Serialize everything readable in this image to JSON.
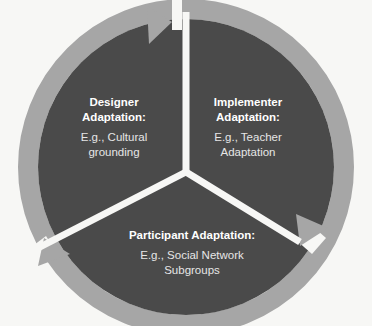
{
  "diagram": {
    "type": "cycle",
    "colors": {
      "background": "#f7f7f5",
      "sector_fill": "#4a4a4a",
      "ring_fill": "#a6a6a6",
      "divider": "#f7f7f5",
      "text": "#ffffff"
    },
    "segments": [
      {
        "title": "Designer Adaptation:",
        "title_line1": "Designer",
        "title_line2": "Adaptation:",
        "example_line1": "E.g., Cultural",
        "example_line2": "grounding"
      },
      {
        "title": "Implementer Adaptation:",
        "title_line1": "Implementer",
        "title_line2": "Adaptation:",
        "example_line1": "E.g., Teacher",
        "example_line2": "Adaptation"
      },
      {
        "title": "Participant Adaptation:",
        "title_line1": "Participant Adaptation:",
        "example_line1": "E.g., Social Network",
        "example_line2": "Subgroups"
      }
    ],
    "arrows": [
      {
        "name": "arrow-designer-to-implementer",
        "direction": "clockwise"
      },
      {
        "name": "arrow-implementer-to-participant",
        "direction": "clockwise"
      },
      {
        "name": "arrow-participant-to-designer",
        "direction": "clockwise"
      }
    ]
  }
}
